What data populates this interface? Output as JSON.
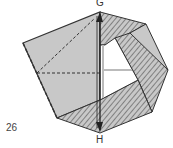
{
  "diagram": {
    "step_number": "26",
    "labels": {
      "top": "G",
      "bottom": "H"
    },
    "colors": {
      "paper": "#c8c8c8",
      "line": "#333333",
      "hatch": "#444444",
      "background": "#ffffff"
    }
  }
}
